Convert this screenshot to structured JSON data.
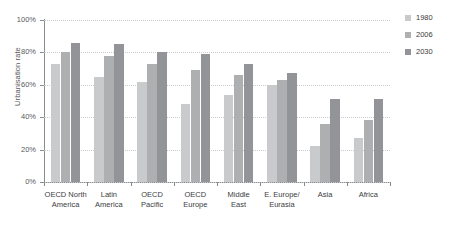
{
  "chart_data": {
    "type": "bar",
    "title": "",
    "xlabel": "",
    "ylabel": "Urbanisation rate",
    "ylim": [
      0,
      100
    ],
    "yticks": [
      "0%",
      "20%",
      "40%",
      "60%",
      "80%",
      "100%"
    ],
    "ytick_values": [
      0,
      20,
      40,
      60,
      80,
      100
    ],
    "grid": true,
    "legend_position": "right",
    "unit": "%",
    "categories": [
      "OECD North America",
      "Latin America",
      "OECD Pacific",
      "OECD Europe",
      "Middle East",
      "E. Europe/Eurasia",
      "Asia",
      "Africa"
    ],
    "category_lines": [
      [
        "OECD North",
        "America"
      ],
      [
        "Latin",
        "America"
      ],
      [
        "OECD",
        "Pacific"
      ],
      [
        "OECD",
        "Europe"
      ],
      [
        "Middle",
        "East"
      ],
      [
        "E. Europe/",
        "Eurasia"
      ],
      [
        "Asia"
      ],
      [
        "Africa"
      ]
    ],
    "series": [
      {
        "name": "1980",
        "color": "#c9cacc",
        "values": [
          73,
          65,
          62,
          48,
          54,
          60,
          22,
          27
        ]
      },
      {
        "name": "2006",
        "color": "#adafb1",
        "values": [
          80,
          78,
          73,
          69,
          66,
          63,
          36,
          38
        ]
      },
      {
        "name": "2030",
        "color": "#929497",
        "values": [
          86,
          85,
          80,
          79,
          73,
          67,
          51,
          51
        ]
      }
    ]
  },
  "legend": {
    "items": [
      {
        "label": "1980",
        "color": "#c9cacc"
      },
      {
        "label": "2006",
        "color": "#adafb1"
      },
      {
        "label": "2030",
        "color": "#929497"
      }
    ]
  }
}
